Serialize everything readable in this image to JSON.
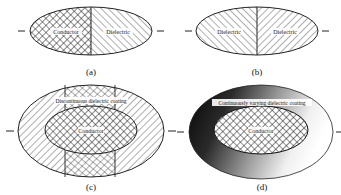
{
  "figure": {
    "panels": [
      {
        "id": "a",
        "caption": "(a)",
        "regions": [
          {
            "name": "Conductor",
            "pattern": "crosshatch"
          },
          {
            "name": "Dielectric",
            "pattern": "diagonal"
          }
        ]
      },
      {
        "id": "b",
        "caption": "(b)",
        "regions": [
          {
            "name": "Dielectric",
            "pattern": "diagonal-left"
          },
          {
            "name": "Dielectric",
            "pattern": "diagonal-right"
          }
        ]
      },
      {
        "id": "c",
        "caption": "(c)",
        "coating_label": "Discontinuous dielectric coating",
        "core_label": "Conductor"
      },
      {
        "id": "d",
        "caption": "(d)",
        "coating_label": "Continuously varying dielectric coating",
        "core_label": "Conductor"
      }
    ],
    "colors": {
      "line": "#222222",
      "gradient_dark": "#0a0a0a",
      "gradient_light": "#ffffff"
    }
  }
}
